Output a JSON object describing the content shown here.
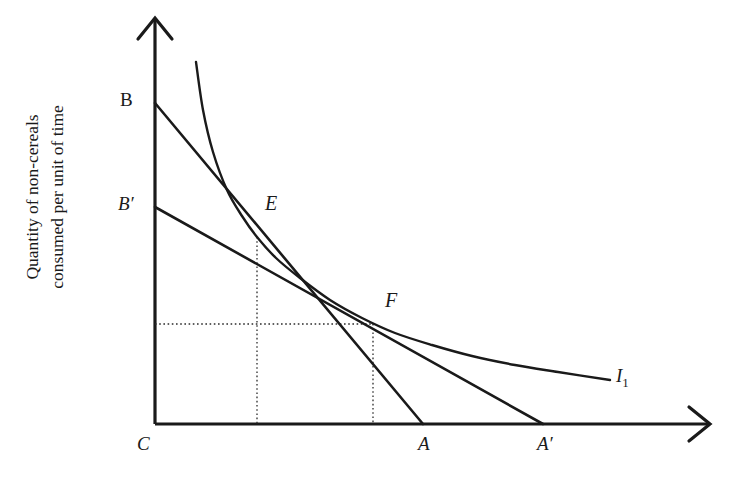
{
  "figure": {
    "type": "economics-indifference-curve-diagram",
    "width": 729,
    "height": 483,
    "background_color": "#ffffff",
    "ink_color": "#1a1a1a"
  },
  "axes": {
    "y_label_line1": "Quantity of non-cereals",
    "y_label_line2": "consumed per unit of time",
    "x_label": "",
    "origin_label": "C",
    "y_axis_x": 155,
    "y_axis_top": 18,
    "x_axis_y": 424,
    "x_axis_right": 710
  },
  "points": [
    {
      "name": "B",
      "label": "B",
      "style": "roman",
      "x": 155,
      "y": 103,
      "label_x": 120,
      "label_y": 90,
      "font_size": 19
    },
    {
      "name": "Bp",
      "label": "B",
      "prime": "′",
      "style": "italic",
      "x": 155,
      "y": 207,
      "label_x": 118,
      "label_y": 194,
      "font_size": 19
    },
    {
      "name": "E",
      "label": "E",
      "style": "italic",
      "x": 257,
      "y": 237,
      "label_x": 265,
      "label_y": 193,
      "font_size": 20
    },
    {
      "name": "F",
      "label": "F",
      "style": "italic",
      "x": 373,
      "y": 324,
      "label_x": 385,
      "label_y": 290,
      "font_size": 20
    },
    {
      "name": "C",
      "label": "C",
      "style": "italic",
      "x": 155,
      "y": 424,
      "label_x": 137,
      "label_y": 434,
      "font_size": 19
    },
    {
      "name": "A",
      "label": "A",
      "style": "italic",
      "x": 423,
      "y": 424,
      "label_x": 418,
      "label_y": 434,
      "font_size": 19
    },
    {
      "name": "Ap",
      "label": "A",
      "prime": "′",
      "style": "italic",
      "x": 543,
      "y": 424,
      "label_x": 537,
      "label_y": 434,
      "font_size": 19
    }
  ],
  "curve_label": {
    "text": "I",
    "subscript": "1",
    "style": "italic",
    "label_x": 616,
    "label_y": 366,
    "font_size": 19
  },
  "chart_data": {
    "type": "line",
    "title": "",
    "xlabel": "",
    "ylabel": "Quantity of non-cereals consumed per unit of time",
    "grid": false,
    "legend": "none",
    "series": [
      {
        "name": "Budget line BA",
        "kind": "budget-line",
        "description": "Original steeper budget constraint from B on the vertical axis to A on the horizontal axis",
        "points": [
          [
            155,
            103
          ],
          [
            423,
            424
          ]
        ]
      },
      {
        "name": "Budget line B'A'",
        "kind": "budget-line",
        "description": "New flatter budget constraint from B-prime on the vertical axis to A-prime on the horizontal axis",
        "points": [
          [
            155,
            207
          ],
          [
            543,
            424
          ]
        ]
      },
      {
        "name": "I1",
        "kind": "indifference-curve",
        "description": "Convex indifference curve tangent to budget line BA at E and to budget line B'A' at F",
        "points": [
          [
            196,
            62
          ],
          [
            203,
            110
          ],
          [
            213,
            152
          ],
          [
            227,
            190
          ],
          [
            242,
            216
          ],
          [
            257,
            237
          ],
          [
            276,
            258
          ],
          [
            300,
            278
          ],
          [
            330,
            300
          ],
          [
            362,
            318
          ],
          [
            395,
            333
          ],
          [
            432,
            345
          ],
          [
            472,
            356
          ],
          [
            515,
            365
          ],
          [
            558,
            372
          ],
          [
            610,
            380
          ]
        ]
      }
    ],
    "tangency_points": [
      {
        "label": "E",
        "on_budget_line": "BA",
        "x": 257,
        "y": 237
      },
      {
        "label": "F",
        "on_budget_line": "B'A'",
        "x": 373,
        "y": 324
      }
    ],
    "guide_lines": [
      {
        "kind": "vertical-dotted",
        "from": [
          257,
          237
        ],
        "to": [
          257,
          424
        ],
        "for_point": "E"
      },
      {
        "kind": "vertical-dotted",
        "from": [
          373,
          324
        ],
        "to": [
          373,
          424
        ],
        "for_point": "F"
      },
      {
        "kind": "horizontal-dotted",
        "from": [
          155,
          324
        ],
        "to": [
          373,
          324
        ],
        "for_point": "F"
      }
    ]
  }
}
